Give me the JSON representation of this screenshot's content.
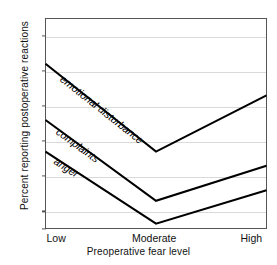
{
  "chart_data": {
    "type": "line",
    "title": "",
    "xlabel": "Preoperative fear level",
    "ylabel": "Percent reporting postoperative reactions",
    "categories": [
      "Low",
      "Moderate",
      "High"
    ],
    "ylim": [
      0,
      60
    ],
    "yticks": [
      0,
      5,
      15,
      25,
      35,
      45,
      55
    ],
    "ytick_labels": [
      "0",
      "5",
      "15",
      "25",
      "35",
      "45",
      "55"
    ],
    "grid": true,
    "legend": "inline-labels",
    "series": [
      {
        "name": "emotional disturbance",
        "values": [
          47,
          22,
          38
        ],
        "color": "#000000"
      },
      {
        "name": "complaints",
        "values": [
          31,
          8,
          18
        ],
        "color": "#000000"
      },
      {
        "name": "anger",
        "values": [
          22,
          1.5,
          11
        ],
        "color": "#000000"
      }
    ]
  },
  "axes": {
    "y_title": "Percent reporting postoperative reactions",
    "x_title": "Preoperative fear level",
    "x_categories": [
      "Low",
      "Moderate",
      "High"
    ],
    "y_ticks": [
      "55",
      "45",
      "35",
      "25",
      "15",
      "5",
      "0"
    ]
  },
  "series_labels": {
    "emotional_disturbance": "emotional disturbance",
    "complaints": "complaints",
    "anger": "anger"
  },
  "colors": {
    "line": "#000000",
    "grid": "#d9d9d9",
    "frame": "#555555",
    "text": "#111111",
    "background": "#ffffff"
  }
}
